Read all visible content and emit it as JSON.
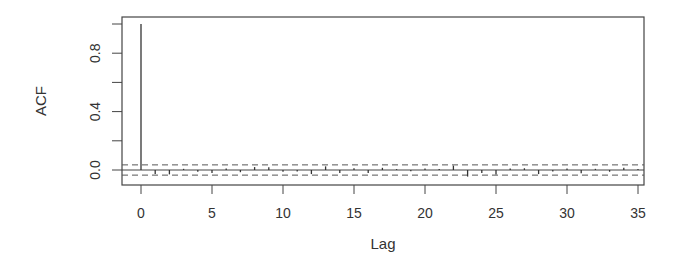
{
  "chart_data": {
    "type": "bar",
    "subtype": "acf-stem",
    "title": "",
    "xlabel": "Lag",
    "ylabel": "ACF",
    "xlim": [
      -1.4,
      35.7
    ],
    "ylim": [
      -0.1,
      1.04
    ],
    "x_ticks": [
      0,
      5,
      10,
      15,
      20,
      25,
      30,
      35
    ],
    "x_tick_labels": [
      "0",
      "5",
      "10",
      "15",
      "20",
      "25",
      "30",
      "35"
    ],
    "y_ticks": [
      0.0,
      0.2,
      0.4,
      0.6,
      0.8,
      1.0
    ],
    "y_tick_labels": [
      "0.0",
      "0.4",
      "0.8"
    ],
    "y_labeled_ticks": [
      0.0,
      0.4,
      0.8
    ],
    "grid": false,
    "legend": null,
    "confidence_bounds": [
      0.035,
      -0.035
    ],
    "x": [
      0,
      1,
      2,
      3,
      4,
      5,
      6,
      7,
      8,
      9,
      10,
      11,
      12,
      13,
      14,
      15,
      16,
      17,
      18,
      19,
      20,
      21,
      22,
      23,
      24,
      25,
      26,
      27,
      28,
      29,
      30,
      31,
      32,
      33,
      34,
      35
    ],
    "values": [
      1.0,
      -0.028,
      -0.03,
      0.008,
      -0.012,
      -0.02,
      0.01,
      -0.015,
      0.02,
      0.018,
      -0.012,
      -0.01,
      -0.028,
      0.025,
      -0.02,
      0.012,
      -0.02,
      0.015,
      0.006,
      -0.008,
      0.01,
      0.006,
      0.03,
      -0.045,
      -0.02,
      -0.03,
      0.01,
      0.012,
      -0.028,
      -0.01,
      0.01,
      -0.022,
      0.008,
      -0.012,
      0.015,
      0.006
    ]
  },
  "labels": {
    "xlabel": "Lag",
    "ylabel": "ACF",
    "y_ticks": [
      "0.0",
      "0.4",
      "0.8"
    ],
    "x_ticks": [
      "0",
      "5",
      "10",
      "15",
      "20",
      "25",
      "30",
      "35"
    ]
  },
  "colors": {
    "stem": "#333333",
    "axis": "#444444",
    "ci_line": "#555555",
    "background": "#ffffff"
  }
}
